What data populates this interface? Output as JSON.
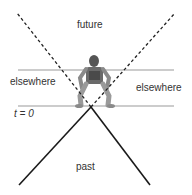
{
  "diagram": {
    "type": "light-cone",
    "labels": {
      "future": "future",
      "past": "past",
      "elsewhere_left": "elsewhere",
      "elsewhere_right": "elsewhere",
      "time_zero": "t = 0"
    },
    "colors": {
      "background": "#ffffff",
      "cone_solid": "#1a1a1a",
      "cone_dashed": "#222222",
      "horizontal_lines": "#999999",
      "text": "#333333"
    },
    "geometry": {
      "apex": [
        91,
        107
      ],
      "future_cone_left_end": [
        17,
        13
      ],
      "future_cone_right_end": [
        175,
        13
      ],
      "past_cone_left_end": [
        19,
        185
      ],
      "past_cone_right_end": [
        150,
        185
      ],
      "upper_line": {
        "x1": 18,
        "x2": 174,
        "y": 70
      },
      "lower_line": {
        "x1": 18,
        "x2": 174,
        "y": 106
      }
    },
    "figure": "seated-person"
  }
}
